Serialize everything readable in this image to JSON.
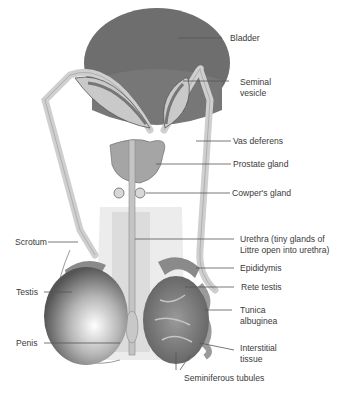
{
  "diagram": {
    "colors": {
      "bladder": "#6e6e6e",
      "duct": "#cfcfcf",
      "skin": "#e9e9e9",
      "testis_dark": "#5a5a5a",
      "leader_line": "#555555",
      "text": "#3a3a3a"
    },
    "labels": [
      {
        "id": "bladder",
        "text": "Bladder"
      },
      {
        "id": "seminal-vesicle",
        "text": "Seminal\nvesicle"
      },
      {
        "id": "vas-deferens",
        "text": "Vas deferens"
      },
      {
        "id": "prostate-gland",
        "text": "Prostate gland"
      },
      {
        "id": "cowpers-gland",
        "text": "Cowper's gland"
      },
      {
        "id": "urethra",
        "text": "Urethra (tiny glands of\nLittre open into urethra)"
      },
      {
        "id": "epididymis",
        "text": "Epididymis"
      },
      {
        "id": "rete-testis",
        "text": "Rete testis"
      },
      {
        "id": "tunica-albuginea",
        "text": "Tunica\nalbuginea"
      },
      {
        "id": "interstitial-tissue",
        "text": "Interstitial\ntissue"
      },
      {
        "id": "seminiferous-tubules",
        "text": "Seminiferous tubules"
      },
      {
        "id": "scrotum",
        "text": "Scrotum"
      },
      {
        "id": "testis",
        "text": "Testis"
      },
      {
        "id": "penis",
        "text": "Penis"
      }
    ]
  }
}
